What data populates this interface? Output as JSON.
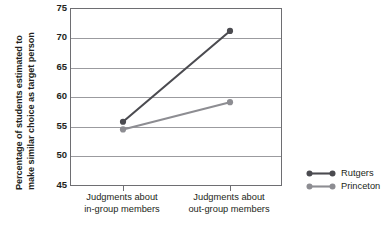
{
  "chart_data": {
    "type": "line",
    "title": "",
    "xlabel": "",
    "ylabel": "Percentage of students estimated to\nmake similar choice as target person",
    "ylabel_line1": "Percentage of students estimated to",
    "ylabel_line2": "make similar choice as target person",
    "categories": [
      "Judgments about in-group members",
      "Judgments about out-group members"
    ],
    "category_lines": [
      [
        "Judgments about",
        "in-group members"
      ],
      [
        "Judgments about",
        "out-group members"
      ]
    ],
    "ylim": [
      45,
      75
    ],
    "yticks": [
      45,
      50,
      55,
      60,
      65,
      70,
      75
    ],
    "ytick_labels": [
      "45",
      "50",
      "55",
      "60",
      "65",
      "70",
      "75"
    ],
    "grid": true,
    "legend_position": "right",
    "series": [
      {
        "name": "Rutgers",
        "color": "#4b4b50",
        "values": [
          56.0,
          71.3
        ]
      },
      {
        "name": "Princeton",
        "color": "#8d8d92",
        "values": [
          54.7,
          59.3
        ]
      }
    ]
  },
  "legend": {
    "items": [
      {
        "label": "Rutgers",
        "color": "#4b4b50"
      },
      {
        "label": "Princeton",
        "color": "#8d8d92"
      }
    ]
  },
  "colors": {
    "axis": "#6e6e72",
    "grid": "#9b9b9f",
    "text": "#231f20",
    "background": "#ffffff"
  }
}
